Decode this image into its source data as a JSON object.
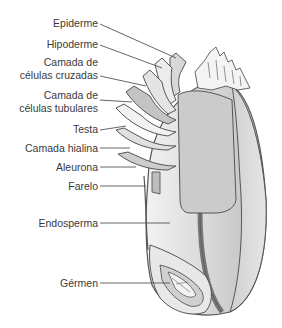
{
  "labels": [
    {
      "id": "epiderme",
      "text": "Epiderme",
      "y": 17
    },
    {
      "id": "hipoderme",
      "text": "Hipoderme",
      "y": 38
    },
    {
      "id": "cruzadas_1",
      "text": "Camada de",
      "y": 55
    },
    {
      "id": "cruzadas_2",
      "text": "células cruzadas",
      "y": 69
    },
    {
      "id": "tubulares_1",
      "text": "Camada de",
      "y": 89
    },
    {
      "id": "tubulares_2",
      "text": "células tubulares",
      "y": 103
    },
    {
      "id": "testa",
      "text": "Testa",
      "y": 123
    },
    {
      "id": "hialina",
      "text": "Camada hialina",
      "y": 142
    },
    {
      "id": "aleurona",
      "text": "Aleurona",
      "y": 161
    },
    {
      "id": "farelo",
      "text": "Farelo",
      "y": 181
    },
    {
      "id": "endosperma",
      "text": "Endosperma",
      "y": 218
    },
    {
      "id": "germen",
      "text": "Gérmen",
      "y": 278
    }
  ],
  "colors": {
    "outline": "#555555",
    "light": "#ebebeb",
    "mid": "#cfcfcf",
    "dark": "#b5b5b5",
    "leader": "#555555",
    "text": "#3a3a3a"
  }
}
